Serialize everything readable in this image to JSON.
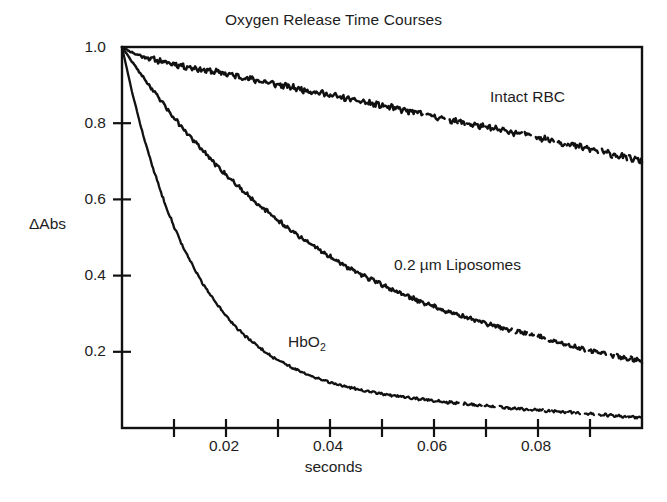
{
  "chart_data": {
    "type": "line",
    "title": "Oxygen Release Time Courses",
    "xlabel": "seconds",
    "ylabel": "ΔAbs",
    "xlim": [
      0,
      0.1
    ],
    "ylim": [
      0,
      1.0
    ],
    "grid": false,
    "legend_position": "inline-annotations",
    "xticks": [
      0.01,
      0.02,
      0.03,
      0.04,
      0.05,
      0.06,
      0.07,
      0.08,
      0.09,
      0.1
    ],
    "xtick_labels": [
      "",
      "0.02",
      "",
      "0.04",
      "",
      "0.06",
      "",
      "0.08",
      "",
      ""
    ],
    "yticks": [
      0.2,
      0.4,
      0.6,
      0.8,
      1.0
    ],
    "ytick_labels": [
      "0.2",
      "0.4",
      "0.6",
      "0.8",
      "1.0"
    ],
    "line_color": "#111111",
    "x": [
      0.0,
      0.002,
      0.004,
      0.006,
      0.008,
      0.01,
      0.012,
      0.014,
      0.016,
      0.018,
      0.02,
      0.022,
      0.024,
      0.026,
      0.028,
      0.03,
      0.032,
      0.034,
      0.036,
      0.038,
      0.04,
      0.042,
      0.044,
      0.046,
      0.048,
      0.05,
      0.052,
      0.054,
      0.056,
      0.058,
      0.06,
      0.062,
      0.064,
      0.066,
      0.068,
      0.07,
      0.072,
      0.074,
      0.076,
      0.078,
      0.08,
      0.082,
      0.084,
      0.086,
      0.088,
      0.09,
      0.092,
      0.094,
      0.096,
      0.098,
      0.1
    ],
    "series": [
      {
        "name": "Intact RBC",
        "label": "Intact RBC",
        "label_x": 0.0715,
        "label_y": 0.875,
        "values": [
          1.0,
          0.985,
          0.975,
          0.968,
          0.96,
          0.956,
          0.949,
          0.945,
          0.938,
          0.935,
          0.93,
          0.924,
          0.918,
          0.912,
          0.907,
          0.901,
          0.896,
          0.89,
          0.885,
          0.88,
          0.874,
          0.868,
          0.862,
          0.857,
          0.851,
          0.846,
          0.84,
          0.835,
          0.829,
          0.824,
          0.818,
          0.812,
          0.806,
          0.8,
          0.795,
          0.789,
          0.784,
          0.779,
          0.774,
          0.769,
          0.764,
          0.757,
          0.75,
          0.744,
          0.738,
          0.732,
          0.726,
          0.719,
          0.713,
          0.707,
          0.701
        ]
      },
      {
        "name": "0.2 µm Liposomes",
        "label": "0.2 µm Liposomes",
        "label_x": 0.053,
        "label_y": 0.44,
        "values": [
          1.0,
          0.96,
          0.922,
          0.885,
          0.849,
          0.815,
          0.782,
          0.751,
          0.721,
          0.692,
          0.665,
          0.639,
          0.614,
          0.59,
          0.567,
          0.545,
          0.524,
          0.504,
          0.485,
          0.467,
          0.45,
          0.433,
          0.418,
          0.403,
          0.389,
          0.376,
          0.363,
          0.351,
          0.34,
          0.329,
          0.319,
          0.309,
          0.3,
          0.291,
          0.283,
          0.275,
          0.267,
          0.26,
          0.253,
          0.247,
          0.241,
          0.232,
          0.224,
          0.217,
          0.21,
          0.204,
          0.198,
          0.192,
          0.186,
          0.181,
          0.176
        ]
      },
      {
        "name": "HbO2",
        "label_html": "HbO<sub>2</sub>",
        "label_x": 0.032,
        "label_y": 0.243,
        "values": [
          1.0,
          0.878,
          0.772,
          0.68,
          0.599,
          0.529,
          0.468,
          0.415,
          0.369,
          0.329,
          0.294,
          0.264,
          0.238,
          0.215,
          0.195,
          0.178,
          0.163,
          0.15,
          0.139,
          0.129,
          0.12,
          0.113,
          0.106,
          0.1,
          0.095,
          0.09,
          0.086,
          0.082,
          0.078,
          0.075,
          0.072,
          0.069,
          0.066,
          0.063,
          0.06,
          0.058,
          0.055,
          0.053,
          0.051,
          0.049,
          0.047,
          0.045,
          0.043,
          0.041,
          0.039,
          0.037,
          0.035,
          0.033,
          0.031,
          0.029,
          0.027
        ]
      }
    ]
  }
}
